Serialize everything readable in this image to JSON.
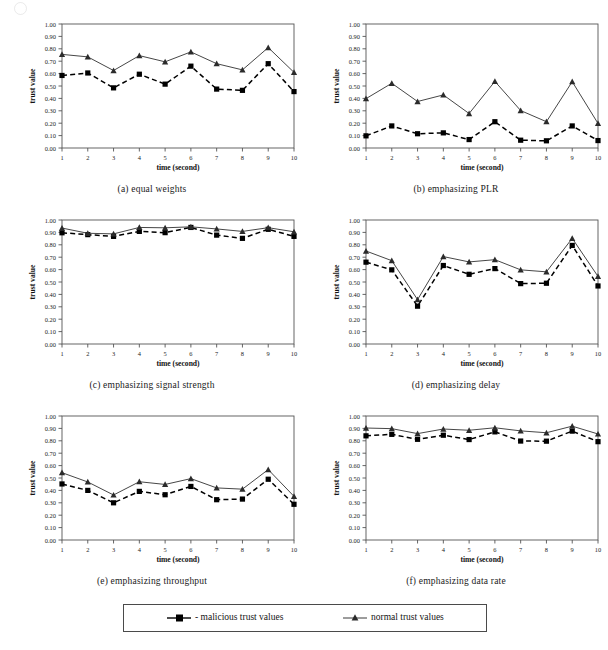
{
  "figure": {
    "axis": {
      "y_label": "trust value",
      "x_label": "time (second)",
      "y_ticks": [
        "0.00",
        "0.10",
        "0.20",
        "0.30",
        "0.40",
        "0.50",
        "0.60",
        "0.70",
        "0.80",
        "0.90",
        "1.00"
      ],
      "x_ticks": [
        "1",
        "2",
        "3",
        "4",
        "5",
        "6",
        "7",
        "8",
        "9",
        "10"
      ]
    },
    "legend": {
      "items": [
        {
          "label": "- malicious trust values",
          "marker": "square-marker",
          "style": "dashed",
          "color": "#000000"
        },
        {
          "label": "normal trust values",
          "marker": "triangle-marker",
          "style": "solid",
          "color": "#3a3a3a"
        }
      ]
    },
    "captions": {
      "a": "(a)  equal weights",
      "b": "(b)  emphasizing PLR",
      "c": "(c)  emphasizing signal strength",
      "d": "(d)  emphasizing delay",
      "e": "(e)  emphasizing throughput",
      "f": "(f)  emphasizing data rate"
    }
  },
  "chart_data": [
    {
      "type": "line",
      "panel": "a",
      "title": "(a)  equal weights",
      "xlabel": "time (second)",
      "ylabel": "trust value",
      "x": [
        1,
        2,
        3,
        4,
        5,
        6,
        7,
        8,
        9,
        10
      ],
      "ylim": [
        0.0,
        1.0
      ],
      "xlim": [
        1,
        10
      ],
      "grid": false,
      "series": [
        {
          "name": "malicious trust values",
          "values": [
            0.585,
            0.605,
            0.485,
            0.595,
            0.515,
            0.66,
            0.475,
            0.465,
            0.68,
            0.455
          ]
        },
        {
          "name": "normal trust values",
          "values": [
            0.755,
            0.735,
            0.625,
            0.745,
            0.695,
            0.775,
            0.68,
            0.63,
            0.81,
            0.61
          ]
        }
      ]
    },
    {
      "type": "line",
      "panel": "b",
      "title": "(b)  emphasizing PLR",
      "xlabel": "time (second)",
      "ylabel": "trust value",
      "x": [
        1,
        2,
        3,
        4,
        5,
        6,
        7,
        8,
        9,
        10
      ],
      "ylim": [
        0.0,
        1.0
      ],
      "xlim": [
        1,
        10
      ],
      "grid": false,
      "series": [
        {
          "name": "malicious trust values",
          "values": [
            0.098,
            0.178,
            0.115,
            0.122,
            0.068,
            0.212,
            0.063,
            0.058,
            0.178,
            0.06
          ]
        },
        {
          "name": "normal trust values",
          "values": [
            0.398,
            0.522,
            0.375,
            0.428,
            0.278,
            0.537,
            0.302,
            0.212,
            0.535,
            0.198
          ]
        }
      ]
    },
    {
      "type": "line",
      "panel": "c",
      "title": "(c)  emphasizing signal strength",
      "xlabel": "time (second)",
      "ylabel": "trust value",
      "x": [
        1,
        2,
        3,
        4,
        5,
        6,
        7,
        8,
        9,
        10
      ],
      "ylim": [
        0.0,
        1.0
      ],
      "xlim": [
        1,
        10
      ],
      "grid": false,
      "series": [
        {
          "name": "malicious trust values",
          "values": [
            0.897,
            0.882,
            0.868,
            0.908,
            0.898,
            0.94,
            0.878,
            0.852,
            0.925,
            0.868
          ]
        },
        {
          "name": "normal trust values",
          "values": [
            0.935,
            0.893,
            0.888,
            0.94,
            0.937,
            0.945,
            0.928,
            0.908,
            0.938,
            0.905
          ]
        }
      ]
    },
    {
      "type": "line",
      "panel": "d",
      "title": "(d)  emphasizing delay",
      "xlabel": "time (second)",
      "ylabel": "trust value",
      "x": [
        1,
        2,
        3,
        4,
        5,
        6,
        7,
        8,
        9,
        10
      ],
      "ylim": [
        0.0,
        1.0
      ],
      "xlim": [
        1,
        10
      ],
      "grid": false,
      "series": [
        {
          "name": "malicious trust values",
          "values": [
            0.66,
            0.598,
            0.305,
            0.633,
            0.562,
            0.608,
            0.487,
            0.49,
            0.795,
            0.468
          ]
        },
        {
          "name": "normal trust values",
          "values": [
            0.75,
            0.672,
            0.358,
            0.705,
            0.662,
            0.68,
            0.598,
            0.582,
            0.852,
            0.545
          ]
        }
      ]
    },
    {
      "type": "line",
      "panel": "e",
      "title": "(e)  emphasizing throughput",
      "xlabel": "time (second)",
      "ylabel": "trust value",
      "x": [
        1,
        2,
        3,
        4,
        5,
        6,
        7,
        8,
        9,
        10
      ],
      "ylim": [
        0.0,
        1.0
      ],
      "xlim": [
        1,
        10
      ],
      "grid": false,
      "series": [
        {
          "name": "malicious trust values",
          "values": [
            0.452,
            0.4,
            0.3,
            0.392,
            0.365,
            0.432,
            0.325,
            0.33,
            0.49,
            0.288
          ]
        },
        {
          "name": "normal trust values",
          "values": [
            0.543,
            0.468,
            0.363,
            0.47,
            0.448,
            0.495,
            0.42,
            0.41,
            0.568,
            0.352
          ]
        }
      ]
    },
    {
      "type": "line",
      "panel": "f",
      "title": "(f)  emphasizing data rate",
      "xlabel": "time (second)",
      "ylabel": "trust value",
      "x": [
        1,
        2,
        3,
        4,
        5,
        6,
        7,
        8,
        9,
        10
      ],
      "ylim": [
        0.0,
        1.0
      ],
      "xlim": [
        1,
        10
      ],
      "grid": false,
      "series": [
        {
          "name": "malicious trust values",
          "values": [
            0.84,
            0.852,
            0.812,
            0.845,
            0.81,
            0.872,
            0.798,
            0.797,
            0.878,
            0.793
          ]
        },
        {
          "name": "normal trust values",
          "values": [
            0.903,
            0.898,
            0.858,
            0.895,
            0.885,
            0.905,
            0.88,
            0.865,
            0.918,
            0.855
          ]
        }
      ]
    }
  ]
}
